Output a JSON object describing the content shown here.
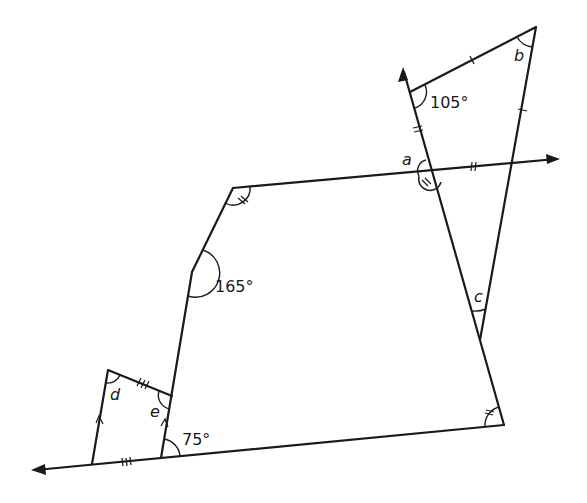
{
  "diagram": {
    "title": "",
    "background": "#ffffff",
    "line_color": "#1a1a1a",
    "angles": {
      "known": [
        {
          "id": "angle-105",
          "label": "105°"
        },
        {
          "id": "angle-165",
          "label": "165°"
        },
        {
          "id": "angle-75",
          "label": "75°"
        }
      ],
      "unknown": [
        {
          "id": "a",
          "label": "a"
        },
        {
          "id": "b",
          "label": "b"
        },
        {
          "id": "c",
          "label": "c"
        },
        {
          "id": "d",
          "label": "d"
        },
        {
          "id": "e",
          "label": "e"
        }
      ]
    },
    "marks": {
      "single_tick": "equal sides of triangle",
      "double_tick": "equal segments / equal angles",
      "triple_tick": "equal sides (small quadrilateral)",
      "parallel_arrows": "parallel sides of small quadrilateral"
    }
  }
}
